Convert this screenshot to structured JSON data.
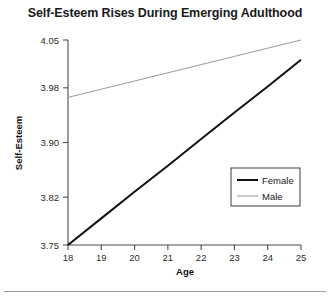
{
  "chart_data": {
    "type": "line",
    "title": "Self-Esteem Rises During Emerging Adulthood",
    "xlabel": "Age",
    "ylabel": "Self-Esteem",
    "x": [
      18,
      19,
      20,
      21,
      22,
      23,
      24,
      25
    ],
    "xticks": [
      "18",
      "19",
      "20",
      "21",
      "22",
      "23",
      "24",
      "25"
    ],
    "xlim": [
      18,
      25
    ],
    "yticks": [
      "3.75",
      "3.82",
      "3.90",
      "3.98",
      "4.05"
    ],
    "ytick_values": [
      3.75,
      3.82,
      3.9,
      3.98,
      4.05
    ],
    "ylim": [
      3.75,
      4.05
    ],
    "grid": false,
    "legend_position": "inside-right",
    "series": [
      {
        "name": "Female",
        "color": "#111111",
        "linewidth": 2,
        "values": [
          3.75,
          3.789,
          3.828,
          3.866,
          3.905,
          3.944,
          3.982,
          4.021
        ]
      },
      {
        "name": "Male",
        "color": "#9b9b9b",
        "linewidth": 1,
        "values": [
          3.966,
          3.978,
          3.99,
          4.002,
          4.014,
          4.026,
          4.038,
          4.05
        ]
      }
    ]
  },
  "legend": {
    "entries": [
      {
        "label": "Female"
      },
      {
        "label": "Male"
      }
    ]
  },
  "colors": {
    "female_line": "#111111",
    "male_line": "#9b9b9b",
    "axis": "#4d4d4d",
    "text": "#1a1a1a",
    "rule": "#9a9a9a"
  }
}
